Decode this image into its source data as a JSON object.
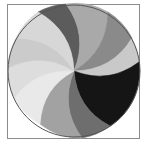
{
  "graphic": {
    "kind": "swirl-pie-icon",
    "frame_color": "#8c8c8c",
    "outline_color": "#555555",
    "center": [
      74,
      71
    ],
    "radius": 66,
    "segments": [
      {
        "name": "segment-1",
        "color": "#5c5c5c",
        "start": [
          38,
          12
        ],
        "end": [
          66,
          4
        ]
      },
      {
        "name": "segment-2",
        "color": "#a9a9a9",
        "start": [
          66,
          4
        ],
        "end": [
          108,
          12
        ]
      },
      {
        "name": "segment-3",
        "color": "#8a8a8a",
        "start": [
          108,
          12
        ],
        "end": [
          132,
          38
        ]
      },
      {
        "name": "segment-4",
        "color": "#c9c9c9",
        "start": [
          132,
          38
        ],
        "end": [
          139,
          62
        ]
      },
      {
        "name": "segment-5",
        "color": "#151515",
        "start": [
          139,
          62
        ],
        "end": [
          110,
          126
        ]
      },
      {
        "name": "segment-6",
        "color": "#6e6e6e",
        "start": [
          110,
          126
        ],
        "end": [
          82,
          138
        ]
      },
      {
        "name": "segment-7",
        "color": "#a2a2a2",
        "start": [
          82,
          138
        ],
        "end": [
          40,
          124
        ]
      },
      {
        "name": "segment-8",
        "color": "#e9e9e9",
        "start": [
          40,
          124
        ],
        "end": [
          14,
          98
        ]
      },
      {
        "name": "segment-9",
        "color": "#dddddd",
        "start": [
          14,
          98
        ],
        "end": [
          8,
          68
        ]
      },
      {
        "name": "segment-10",
        "color": "#cbcbcb",
        "start": [
          8,
          68
        ],
        "end": [
          16,
          38
        ]
      },
      {
        "name": "segment-11",
        "color": "#d7d7d7",
        "start": [
          16,
          38
        ],
        "end": [
          38,
          12
        ]
      }
    ]
  }
}
